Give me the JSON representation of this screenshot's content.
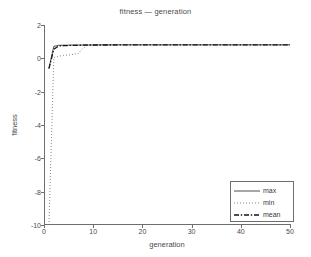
{
  "chart_data": {
    "type": "line",
    "title": "fitness — generation",
    "xlabel": "generation",
    "ylabel": "fitness",
    "xlim": [
      0,
      50
    ],
    "ylim": [
      -10,
      2
    ],
    "grid": false,
    "legend_position": "lower right",
    "xticks": [
      0,
      10,
      20,
      30,
      40,
      50
    ],
    "xtick_labels": [
      "0",
      "10",
      "20",
      "30",
      "40",
      "50"
    ],
    "yticks": [
      2,
      0,
      -2,
      -4,
      -6,
      -8,
      -10
    ],
    "ytick_labels": [
      "2",
      "0",
      "-2",
      "-4",
      "-6",
      "-8",
      "-10"
    ],
    "x": [
      1,
      2,
      3,
      4,
      5,
      6,
      7,
      8,
      9,
      10,
      12,
      14,
      16,
      18,
      20,
      22,
      24,
      26,
      28,
      30,
      32,
      34,
      36,
      38,
      40,
      42,
      44,
      46,
      48,
      50
    ],
    "series": [
      {
        "name": "max",
        "style": "solid",
        "color": "#3a3a3a",
        "values": [
          -0.6,
          0.72,
          0.78,
          0.79,
          0.79,
          0.8,
          0.8,
          0.8,
          0.8,
          0.8,
          0.81,
          0.81,
          0.81,
          0.81,
          0.81,
          0.81,
          0.81,
          0.81,
          0.81,
          0.81,
          0.81,
          0.81,
          0.81,
          0.81,
          0.81,
          0.81,
          0.81,
          0.81,
          0.81,
          0.81
        ]
      },
      {
        "name": "min",
        "style": "dotted",
        "color": "#7a7a7a",
        "values": [
          -10.0,
          0.05,
          0.12,
          0.18,
          0.2,
          0.24,
          0.3,
          0.62,
          0.79,
          0.8,
          0.8,
          0.8,
          0.81,
          0.81,
          0.81,
          0.81,
          0.81,
          0.81,
          0.81,
          0.81,
          0.81,
          0.81,
          0.81,
          0.81,
          0.81,
          0.81,
          0.81,
          0.81,
          0.81,
          0.81
        ]
      },
      {
        "name": "mean",
        "style": "dashdot",
        "color": "#151515",
        "values": [
          -0.62,
          0.55,
          0.74,
          0.76,
          0.77,
          0.78,
          0.78,
          0.79,
          0.8,
          0.8,
          0.8,
          0.8,
          0.81,
          0.81,
          0.81,
          0.81,
          0.81,
          0.81,
          0.81,
          0.81,
          0.81,
          0.81,
          0.81,
          0.81,
          0.81,
          0.81,
          0.81,
          0.81,
          0.81,
          0.81
        ]
      }
    ],
    "legend_entries": [
      {
        "label": "max",
        "style": "solid"
      },
      {
        "label": "min",
        "style": "dotted"
      },
      {
        "label": "mean",
        "style": "dashdot"
      }
    ]
  }
}
